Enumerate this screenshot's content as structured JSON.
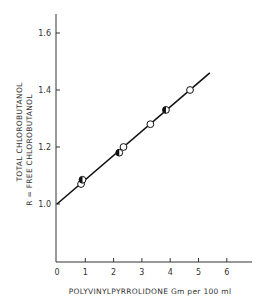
{
  "chart_data": {
    "type": "scatter",
    "title": "",
    "xlabel": "POLYVINYLPYRROLIDONE  Gm per 100 ml",
    "ylabel_line1": "TOTAL CHLOROBUTANOL",
    "ylabel_line2": "R = FREE CHLOROBUTANOL",
    "xlim": [
      0,
      7
    ],
    "ylim": [
      0.8,
      1.65
    ],
    "x_ticks": [
      0,
      1,
      2,
      3,
      4,
      5,
      6
    ],
    "y_ticks": [
      1.0,
      1.2,
      1.4,
      1.6
    ],
    "y_tick_labels": [
      "1.0",
      "1.2",
      "1.4",
      "1.6"
    ],
    "grid": false,
    "series": [
      {
        "name": "open circles",
        "marker": "open-circle",
        "points": [
          {
            "x": 0.85,
            "y": 1.07
          },
          {
            "x": 2.35,
            "y": 1.2
          },
          {
            "x": 3.3,
            "y": 1.28
          },
          {
            "x": 4.7,
            "y": 1.4
          }
        ]
      },
      {
        "name": "half-filled circles",
        "marker": "half-filled-circle",
        "points": [
          {
            "x": 0.9,
            "y": 1.085
          },
          {
            "x": 2.2,
            "y": 1.18
          },
          {
            "x": 3.85,
            "y": 1.33
          }
        ]
      }
    ],
    "fit_line": {
      "x_start": 0,
      "y_start": 1.0,
      "x_end": 5.4,
      "y_end": 1.46,
      "slope": 0.085
    }
  }
}
